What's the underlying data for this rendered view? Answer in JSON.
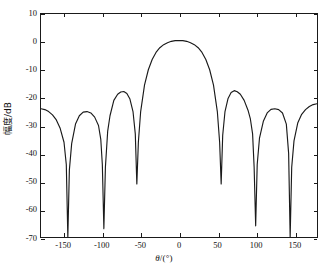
{
  "figure": {
    "background_color": "#ffffff",
    "axis_color": "#1a1a1a",
    "curve_color": "#1a1a1a"
  },
  "axes": {
    "y_title": "幅度/dB",
    "x_title_symbol": "θ",
    "x_title_unit": "/(°)",
    "y_ticks": [
      "10",
      "0",
      "-10",
      "-20",
      "-30",
      "-40",
      "-50",
      "-60",
      "-70"
    ],
    "x_ticks": [
      "-150",
      "-100",
      "-50",
      "0",
      "50",
      "100",
      "150"
    ]
  },
  "chart_data": {
    "type": "line",
    "title": "",
    "xlabel": "θ/(°)",
    "ylabel": "幅度/dB",
    "xlim": [
      -180,
      180
    ],
    "ylim": [
      -70,
      10
    ],
    "xticks": [
      -150,
      -100,
      -50,
      0,
      50,
      100,
      150
    ],
    "yticks": [
      10,
      0,
      -10,
      -20,
      -30,
      -40,
      -50,
      -60,
      -70
    ],
    "grid": false,
    "legend": "none",
    "series": [
      {
        "name": "Array beam pattern",
        "color": "#1a1a1a",
        "description": "Antenna array radiation pattern: main lobe at 0 deg peaking near 0 dB, with six deep nulls and six side lobes symmetric about 0 deg.",
        "main_lobe_peak_deg": 0,
        "main_lobe_peak_db": 0.5,
        "nulls_deg": [
          -145,
          -98,
          -55,
          55,
          98,
          145
        ],
        "null_depths_db": [
          -70,
          -67,
          -51,
          -51,
          -66,
          -70
        ],
        "sidelobe_peaks_deg": [
          -180,
          -120,
          -72,
          72,
          118,
          180
        ],
        "sidelobe_peaks_db": [
          -24,
          -25,
          -18,
          -17.5,
          -24,
          -22
        ],
        "x": [
          -180,
          -175,
          -170,
          -165,
          -160,
          -155,
          -150,
          -147,
          -145,
          -143,
          -140,
          -135,
          -130,
          -125,
          -120,
          -115,
          -110,
          -105,
          -102,
          -100,
          -98,
          -96,
          -93,
          -90,
          -85,
          -80,
          -76,
          -72,
          -68,
          -64,
          -60,
          -57,
          -55,
          -53,
          -50,
          -45,
          -40,
          -35,
          -30,
          -25,
          -20,
          -15,
          -10,
          -5,
          0,
          5,
          10,
          15,
          20,
          25,
          30,
          35,
          40,
          45,
          50,
          53,
          55,
          57,
          60,
          64,
          68,
          72,
          76,
          80,
          85,
          90,
          93,
          96,
          98,
          100,
          102,
          105,
          110,
          115,
          120,
          125,
          130,
          135,
          140,
          143,
          145,
          147,
          150,
          155,
          160,
          165,
          170,
          175,
          180
        ],
        "y": [
          -24.0,
          -24.3,
          -25.0,
          -26.2,
          -28.0,
          -31.0,
          -36.0,
          -44.0,
          -70.0,
          -46.0,
          -36.5,
          -29.5,
          -26.5,
          -25.2,
          -25.0,
          -25.5,
          -27.0,
          -30.0,
          -35.0,
          -44.0,
          -67.0,
          -45.0,
          -32.0,
          -26.5,
          -21.0,
          -18.8,
          -18.0,
          -17.8,
          -18.5,
          -20.5,
          -25.0,
          -33.0,
          -51.0,
          -36.0,
          -25.0,
          -15.5,
          -10.0,
          -6.3,
          -3.8,
          -2.1,
          -1.0,
          -0.3,
          0.2,
          0.45,
          0.5,
          0.45,
          0.2,
          -0.3,
          -1.0,
          -2.1,
          -3.8,
          -6.3,
          -10.0,
          -15.5,
          -25.0,
          -36.0,
          -51.0,
          -33.5,
          -25.0,
          -20.3,
          -18.2,
          -17.5,
          -17.9,
          -18.8,
          -21.0,
          -24.5,
          -27.5,
          -33.0,
          -45.0,
          -66.0,
          -44.0,
          -34.5,
          -28.5,
          -25.5,
          -24.2,
          -24.0,
          -24.3,
          -25.5,
          -29.5,
          -40.0,
          -70.0,
          -45.0,
          -35.5,
          -29.0,
          -26.0,
          -24.3,
          -23.2,
          -22.5,
          -22.2
        ]
      }
    ]
  }
}
